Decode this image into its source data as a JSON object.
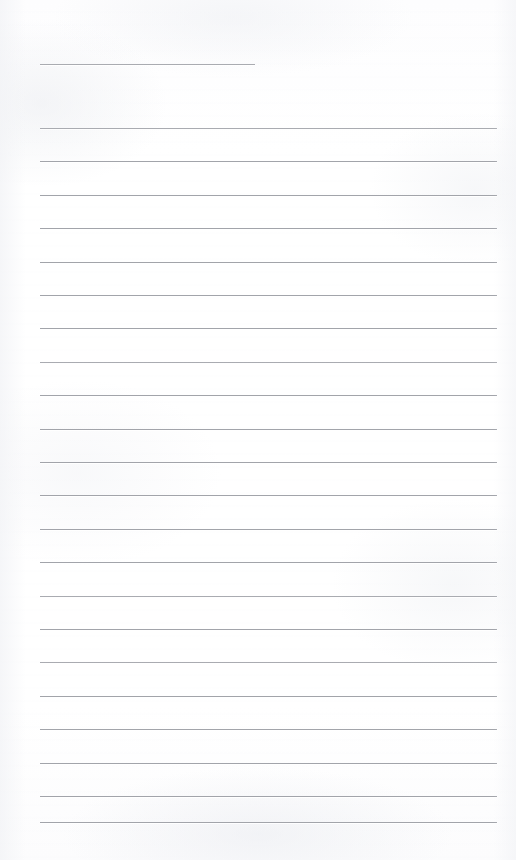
{
  "document": {
    "kind": "lined-notebook-page",
    "title_text": "",
    "body_text": "",
    "page_width": 516,
    "page_height": 860,
    "paper_color": "#ffffff",
    "rule_color": "#a2a4aa",
    "is_blank": true,
    "content_note": ""
  },
  "ruling": {
    "left_margin_x": 40,
    "right_margin_x": 497,
    "line_spacing": 33.4,
    "line_thickness": 1,
    "first_full_line_y": 128,
    "last_full_line_y": 822,
    "full_line_count": 21,
    "header_rule": {
      "label": "title-rule",
      "x_start": 40,
      "x_end": 255,
      "y": 64,
      "width": 215
    },
    "full_line_y_positions": [
      128,
      161.4,
      194.8,
      228.2,
      261.6,
      295,
      328.4,
      361.8,
      395.2,
      428.6,
      462,
      495.4,
      528.8,
      562.2,
      595.6,
      629,
      662.4,
      695.8,
      729.2,
      762.6,
      796,
      822
    ]
  }
}
